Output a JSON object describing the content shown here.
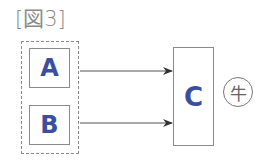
{
  "figure": {
    "title": "[図3]",
    "group": {
      "style": "dashed",
      "members": [
        "A",
        "B"
      ]
    },
    "nodes": [
      {
        "id": "A",
        "label": "A"
      },
      {
        "id": "B",
        "label": "B"
      },
      {
        "id": "C",
        "label": "C"
      }
    ],
    "edges": [
      {
        "from": "A",
        "to": "C"
      },
      {
        "from": "B",
        "to": "C"
      }
    ],
    "annotation": {
      "label": "牛",
      "style": "circled"
    },
    "colors": {
      "node_text": "#3a4f9e",
      "border": "#8a8a8a",
      "arrow": "#444444"
    }
  }
}
